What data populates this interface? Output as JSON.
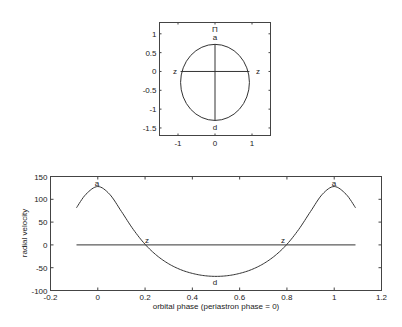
{
  "chart_data": [
    {
      "type": "line",
      "title": "",
      "xlabel": "",
      "ylabel": "",
      "xlim": [
        -1.5,
        1.5
      ],
      "ylim": [
        -1.7,
        1.3
      ],
      "xticks": [
        -1,
        0,
        1
      ],
      "xtick_labels": [
        "-1",
        "0",
        "1"
      ],
      "yticks": [
        1,
        0.5,
        0,
        -0.5,
        -1,
        -1.5
      ],
      "ytick_labels": [
        "1",
        "0.5",
        "0",
        "-0.5",
        "-1",
        "-1.5"
      ],
      "grid": false,
      "series": [
        {
          "name": "orbit ellipse",
          "shape": "ellipse",
          "center": [
            0,
            -0.29
          ],
          "rx": 0.93,
          "ry": 1.01
        },
        {
          "name": "line of nodes",
          "x": [
            -0.93,
            0.93
          ],
          "y": [
            0,
            0
          ]
        },
        {
          "name": "line of apsides",
          "x": [
            0,
            0
          ],
          "y": [
            0.72,
            -1.3
          ]
        }
      ],
      "annotations": [
        {
          "text": "Π",
          "x": 0,
          "y": 1.1
        },
        {
          "text": "a",
          "x": 0,
          "y": 0.92
        },
        {
          "text": "z",
          "x": -1.15,
          "y": 0
        },
        {
          "text": "z",
          "x": 1.15,
          "y": 0
        },
        {
          "text": "d",
          "x": 0,
          "y": -1.5
        }
      ]
    },
    {
      "type": "line",
      "title": "",
      "xlabel": "orbital phase (periastron phase = 0)",
      "ylabel": "radial velocity",
      "xlim": [
        -0.2,
        1.2
      ],
      "ylim": [
        -100,
        150
      ],
      "xticks": [
        -0.2,
        0,
        0.2,
        0.4,
        0.6,
        0.8,
        1,
        1.2
      ],
      "xtick_labels": [
        "-0.2",
        "0",
        "0.2",
        "0.4",
        "0.6",
        "0.8",
        "1",
        "1.2"
      ],
      "yticks": [
        150,
        100,
        50,
        0,
        -50,
        -100
      ],
      "ytick_labels": [
        "150",
        "100",
        "50",
        "0",
        "-50",
        "-100"
      ],
      "grid": false,
      "x": [
        -0.09,
        -0.05,
        0,
        0.05,
        0.1,
        0.15,
        0.2,
        0.25,
        0.3,
        0.35,
        0.4,
        0.45,
        0.5,
        0.55,
        0.6,
        0.65,
        0.7,
        0.75,
        0.8,
        0.85,
        0.9,
        0.95,
        1.0,
        1.05,
        1.09
      ],
      "series": [
        {
          "name": "radial velocity",
          "values": [
            81.5,
            111.1,
            128,
            111.1,
            73.3,
            34.0,
            1.3,
            -23.4,
            -41.5,
            -54.2,
            -62.5,
            -67.4,
            -69.0,
            -67.4,
            -62.5,
            -54.2,
            -41.5,
            -23.4,
            1.3,
            34.0,
            73.3,
            111.1,
            128,
            111.1,
            81.5
          ]
        },
        {
          "name": "zero line",
          "x": [
            -0.09,
            1.09
          ],
          "values": [
            0,
            0
          ]
        }
      ],
      "annotations": [
        {
          "text": "a",
          "x": 0,
          "y": 128
        },
        {
          "text": "z",
          "x": 0.21,
          "y": 0
        },
        {
          "text": "d",
          "x": 0.5,
          "y": -69
        },
        {
          "text": "z",
          "x": 0.79,
          "y": 0
        },
        {
          "text": "a",
          "x": 1.0,
          "y": 128
        }
      ]
    }
  ],
  "top": {
    "annotations": {
      "pi": "Π",
      "a": "a",
      "z_left": "z",
      "z_right": "z",
      "d": "d"
    },
    "xticks": [
      "-1",
      "0",
      "1"
    ],
    "yticks": [
      "1",
      "0.5",
      "0",
      "-0.5",
      "-1",
      "-1.5"
    ]
  },
  "bottom": {
    "xlabel": "orbital phase (periastron phase = 0)",
    "ylabel": "radial velocity",
    "annotations": {
      "a1": "a",
      "z1": "z",
      "d": "d",
      "z2": "z",
      "a2": "a"
    },
    "xticks": [
      "-0.2",
      "0",
      "0.2",
      "0.4",
      "0.6",
      "0.8",
      "1",
      "1.2"
    ],
    "yticks": [
      "150",
      "100",
      "50",
      "0",
      "-50",
      "-100"
    ]
  }
}
